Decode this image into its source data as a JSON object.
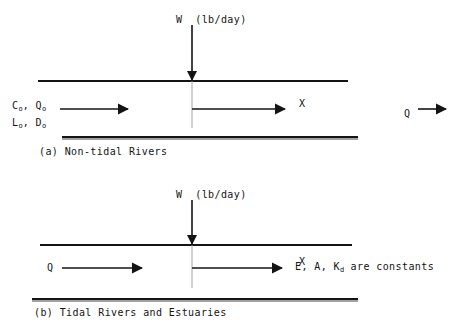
{
  "figure": {
    "background_color": "#ffffff",
    "line_color": "#141414",
    "width": 452,
    "height": 329
  },
  "panel_a": {
    "caption": "(a) Non-tidal Rivers",
    "load_label": "W  (lb/day)",
    "distance_label": "X",
    "upstream_line1_main": "C",
    "upstream_line1_sub1": "o",
    "upstream_line1_sep": ", Q",
    "upstream_line1_sub2": "o",
    "upstream_line2_main": "L",
    "upstream_line2_sub1": "o",
    "upstream_line2_sep": ", D",
    "upstream_line2_sub2": "o",
    "downstream_flow_label": "Q"
  },
  "panel_b": {
    "caption": "(b) Tidal Rivers and Estuaries",
    "load_label": "W  (lb/day)",
    "distance_label": "X",
    "flow_label": "Q",
    "constants_main": "E, A, K",
    "constants_sub": "d",
    "constants_tail": " are constants"
  }
}
